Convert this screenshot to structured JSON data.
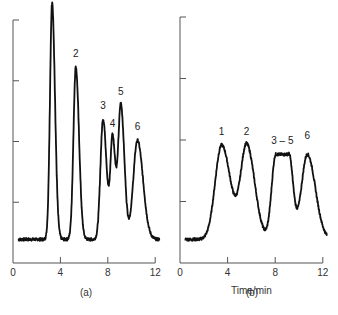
{
  "chart_data": [
    {
      "type": "line",
      "panel_label": "(a)",
      "title": "",
      "xlabel": "",
      "ylabel": "",
      "xlim": [
        0,
        12.5
      ],
      "x_ticks": [
        "0",
        "4",
        "8",
        "12"
      ],
      "y_ticks_count": 4,
      "grid": false,
      "baseline": 0.1,
      "peaks": [
        {
          "label": "1",
          "x": 3.3,
          "height": 1.0,
          "width": 0.18
        },
        {
          "label": "2",
          "x": 5.3,
          "height": 0.73,
          "width": 0.2
        },
        {
          "label": "3",
          "x": 7.6,
          "height": 0.51,
          "width": 0.22
        },
        {
          "label": "4",
          "x": 8.4,
          "height": 0.43,
          "width": 0.18
        },
        {
          "label": "5",
          "x": 9.1,
          "height": 0.57,
          "width": 0.22
        },
        {
          "label": "6",
          "x": 10.5,
          "height": 0.42,
          "width": 0.35
        }
      ]
    },
    {
      "type": "line",
      "panel_label": "(b)",
      "title": "",
      "xlabel": "Time/min",
      "ylabel": "",
      "xlim": [
        0,
        12.5
      ],
      "x_ticks": [
        "0",
        "4",
        "8",
        "12"
      ],
      "y_ticks_count": 4,
      "grid": false,
      "baseline": 0.1,
      "peaks": [
        {
          "label": "1",
          "x": 3.5,
          "height": 0.4,
          "width": 0.55
        },
        {
          "label": "2",
          "x": 5.6,
          "height": 0.4,
          "width": 0.5
        },
        {
          "label": "3 – 5",
          "x": 8.6,
          "height": 0.36,
          "width": 0.9
        },
        {
          "label": "6",
          "x": 10.7,
          "height": 0.36,
          "width": 0.5
        }
      ]
    }
  ]
}
